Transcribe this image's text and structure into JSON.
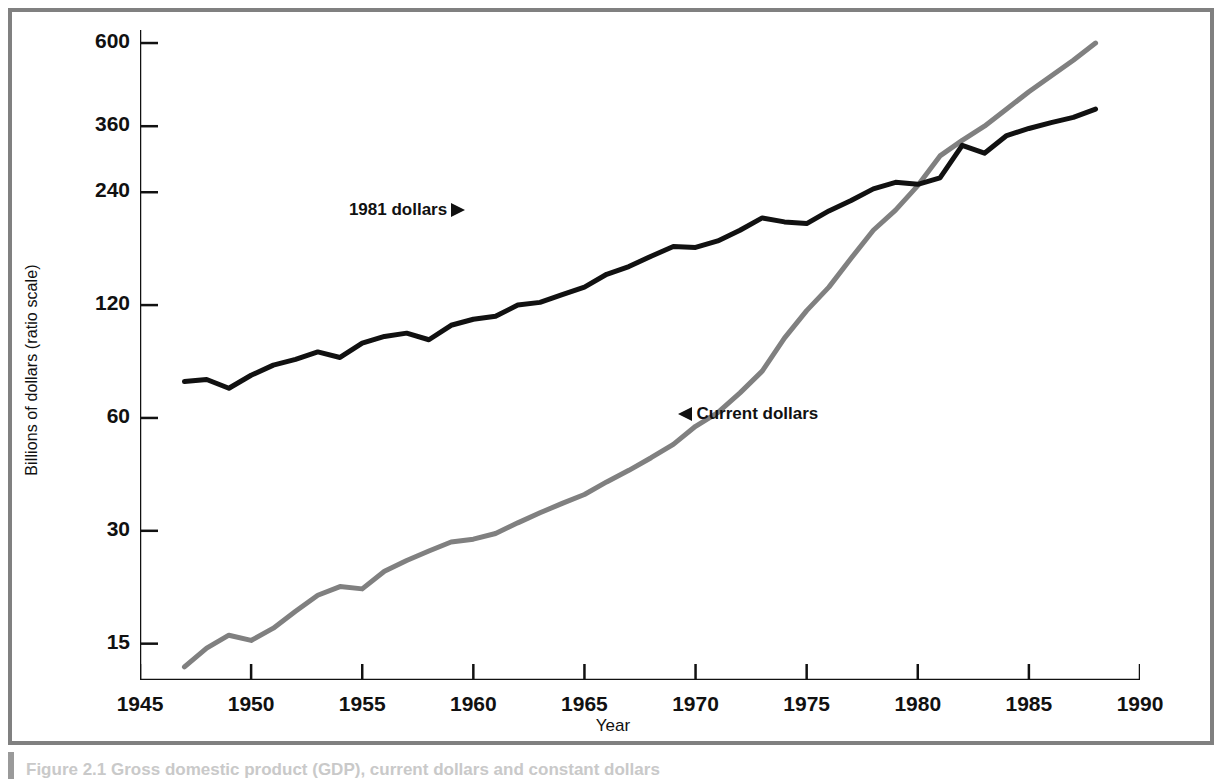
{
  "figure": {
    "caption": "Figure 2.1  Gross domestic product (GDP), current dollars and constant dollars",
    "x_axis_title": "Year",
    "y_axis_title": "Billions of dollars (ratio scale)"
  },
  "annotations": {
    "real_label": "1981 dollars",
    "nominal_label": "Current dollars"
  },
  "colors": {
    "real_series": "#111111",
    "nominal_series": "#808080",
    "frame": "#808080",
    "axis": "#111111"
  },
  "chart_data": {
    "type": "line",
    "title": "",
    "xlabel": "Year",
    "ylabel": "Billions of dollars (ratio scale)",
    "yscale": "log",
    "ylim": [
      12,
      650
    ],
    "xlim": [
      1945,
      1990
    ],
    "grid": false,
    "legend": "inline-annotations",
    "ytick_labels": [
      "600",
      "360",
      "240",
      "120",
      "60",
      "30",
      "15"
    ],
    "ytick_values": [
      600,
      360,
      240,
      120,
      60,
      30,
      15
    ],
    "xtick_labels": [
      "1945",
      "1950",
      "1955",
      "1960",
      "1965",
      "1970",
      "1975",
      "1980",
      "1985",
      "1990"
    ],
    "xtick_values": [
      1945,
      1950,
      1955,
      1960,
      1965,
      1970,
      1975,
      1980,
      1985,
      1990
    ],
    "x": [
      1947,
      1948,
      1949,
      1950,
      1951,
      1952,
      1953,
      1954,
      1955,
      1956,
      1957,
      1958,
      1959,
      1960,
      1961,
      1962,
      1963,
      1964,
      1965,
      1966,
      1967,
      1968,
      1969,
      1970,
      1971,
      1972,
      1973,
      1974,
      1975,
      1976,
      1977,
      1978,
      1979,
      1980,
      1981,
      1982,
      1983,
      1984,
      1985,
      1986,
      1987,
      1988
    ],
    "series": [
      {
        "name": "Current dollars",
        "color": "#808080",
        "values": [
          13.0,
          14.6,
          15.8,
          15.3,
          16.5,
          18.3,
          20.2,
          21.3,
          21.0,
          23.4,
          25.0,
          26.5,
          28.0,
          28.5,
          29.5,
          31.5,
          33.5,
          35.5,
          37.5,
          40.5,
          43.5,
          47.0,
          51.0,
          57.0,
          62.0,
          70.0,
          80.0,
          98.0,
          116.0,
          134.0,
          160.0,
          190.0,
          215.0,
          250.0,
          300.0,
          330.0,
          360.0,
          400.0,
          445.0,
          490.0,
          540.0,
          600.0
        ]
      },
      {
        "name": "1981 dollars",
        "color": "#111111",
        "values": [
          75.0,
          76.0,
          72.0,
          78.0,
          83.0,
          86.0,
          90.0,
          87.0,
          95.0,
          99.0,
          101.0,
          97.0,
          106.0,
          110.0,
          112.0,
          120.0,
          122.0,
          128.0,
          134.0,
          145.0,
          152.0,
          162.0,
          172.0,
          171.0,
          178.0,
          190.0,
          205.0,
          200.0,
          198.0,
          214.0,
          228.0,
          245.0,
          255.0,
          252.0,
          262.0,
          320.0,
          305.0,
          340.0,
          355.0,
          368.0,
          380.0,
          400.0
        ]
      }
    ]
  }
}
